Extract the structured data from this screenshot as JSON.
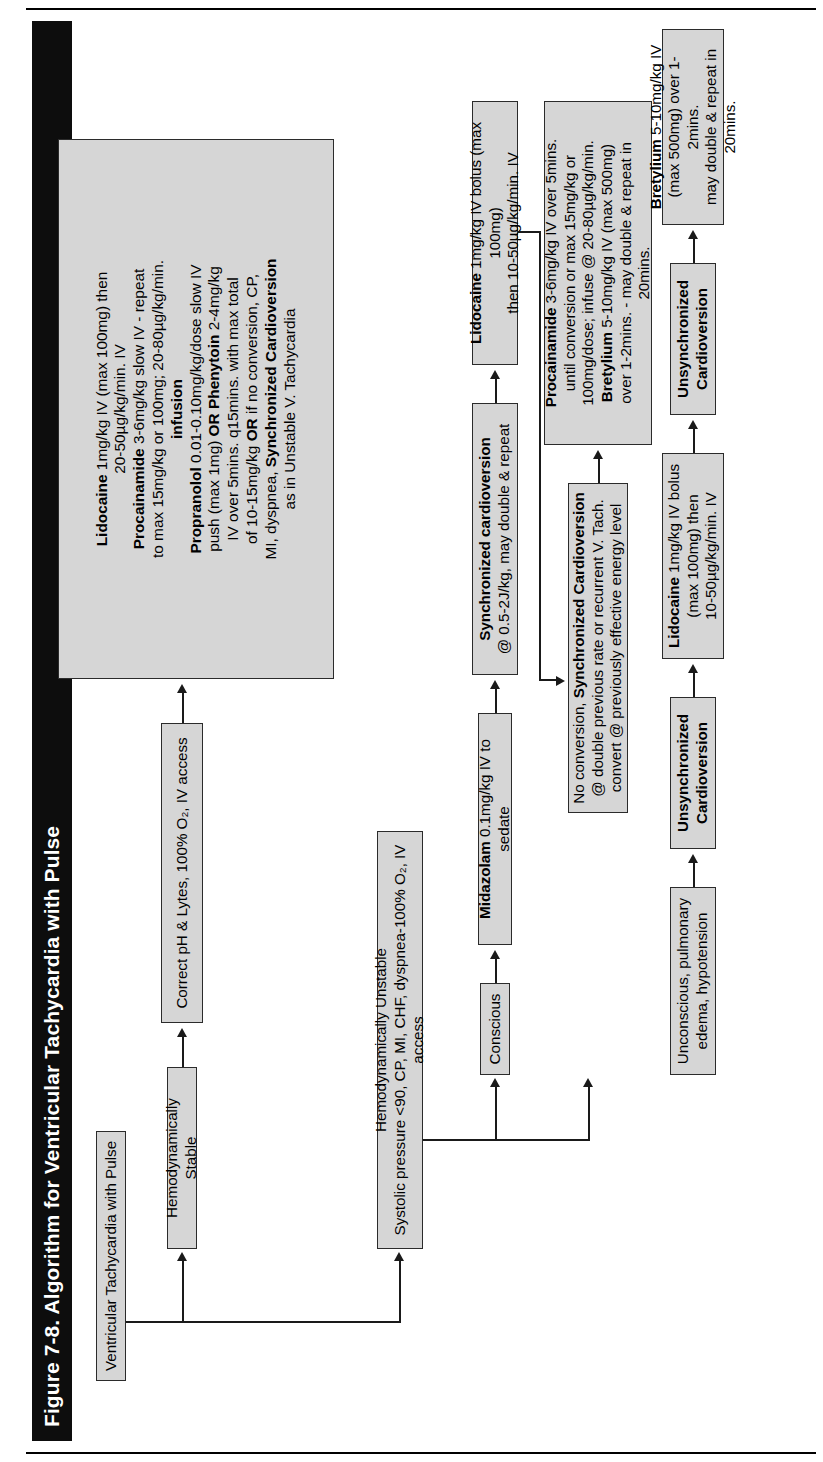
{
  "figure": {
    "title": "Figure 7-8. Algorithm for Ventricular Tachycardia with Pulse",
    "orientation": "rotated-90-ccw",
    "page_rules": 2
  },
  "colors": {
    "title_bar": "#0d0d0d",
    "title_text": "#ffffff",
    "node_fill": "#d6d6d6",
    "node_border": "#2b2b2b",
    "connector": "#1a1a1a",
    "page_background": "#ffffff"
  },
  "nodes": {
    "root": {
      "id": "root",
      "label": "Ventricular Tachycardia with Pulse"
    },
    "stable": {
      "id": "stable",
      "label": "Hemodynamically Stable"
    },
    "correct": {
      "id": "correct",
      "label": "Correct pH & Lytes, 100% O₂, IV access"
    },
    "stable_drugs": {
      "id": "stable-drug-protocol",
      "lines": [
        {
          "bold": "Lidocaine",
          "rest": " 1mg/kg IV (max 100mg) then"
        },
        {
          "bold": "",
          "rest": "20-50µg/kg/min. IV"
        },
        {
          "bold": "Procainamide",
          "rest": " 3-6mg/kg slow IV - repeat"
        },
        {
          "bold": "",
          "rest": "to max 15mg/kg or 100mg; 20-80µg/kg/min."
        },
        {
          "bold": "infusion",
          "rest": ""
        },
        {
          "bold": "Propranolol",
          "rest": " 0.01-0.10mg/kg/dose slow IV"
        },
        {
          "bold": "",
          "rest": "push (max 1mg) OR Phenytoin 2-4mg/kg"
        },
        {
          "bold": "",
          "rest": "IV over 5mins. q15mins. with max total"
        },
        {
          "bold": "",
          "rest": "of 10-15mg/kg OR if no conversion, CP,"
        },
        {
          "bold": "",
          "rest": "MI, dyspnea, Synchronized Cardioversion"
        },
        {
          "bold": "",
          "rest": "as in Unstable V. Tachycardia"
        }
      ]
    },
    "unstable": {
      "id": "unstable",
      "line1": "Hemodynamically Unstable",
      "line2": "Systolic pressure <90, CP, MI, CHF, dyspnea-100% O₂, IV access"
    },
    "conscious": {
      "id": "conscious",
      "label": "Conscious"
    },
    "midazolam": {
      "id": "midazolam",
      "bold": "Midazolam",
      "rest": " 0.1mg/kg IV to sedate"
    },
    "sync_cardio_1": {
      "id": "synchronized-cardioversion-dose",
      "line1_bold": "Synchronized cardioversion",
      "line2": "@ 0.5-2J/kg, may double & repeat"
    },
    "lidocaine_conscious": {
      "id": "lidocaine-conscious",
      "bold": "Lidocaine",
      "rest": " 1mg/kg IV bolus (max 100mg)",
      "line2": "then 10-50µg/kg/min. IV"
    },
    "no_conversion": {
      "id": "no-conversion-sync-cardioversion",
      "line1_pre": "No conversion, ",
      "line1_bold": "Synchronized Cardioversion",
      "line2": "@ double previous rate or recurrent V. Tach.",
      "line3": "convert @ previously effective energy level"
    },
    "procainamide_bretylium": {
      "id": "procainamide-bretylium",
      "lines": [
        {
          "bold": "Procainamide",
          "rest": " 3-6mg/kg IV over 5mins."
        },
        {
          "bold": "",
          "rest": "until conversion or max 15mg/kg or"
        },
        {
          "bold": "",
          "rest": "100mg/dose; infuse @ 20-80µg/kg/min."
        },
        {
          "bold": "Bretylium",
          "rest": " 5-10mg/kg IV (max 500mg)"
        },
        {
          "bold": "",
          "rest": "over 1-2mins. - may double & repeat in"
        },
        {
          "bold": "",
          "rest": "20mins."
        }
      ]
    },
    "unconscious": {
      "id": "unconscious",
      "line1": "Unconscious, pulmonary",
      "line2": "edema, hypotension"
    },
    "unsync_cardio_1": {
      "id": "unsynchronized-cardioversion-1",
      "line1": "Unsynchronized",
      "line2": "Cardioversion"
    },
    "lidocaine_unconscious": {
      "id": "lidocaine-unconscious",
      "bold": "Lidocaine",
      "rest": " 1mg/kg IV bolus",
      "line2": "(max 100mg) then",
      "line3": "10-50µg/kg/min. IV"
    },
    "unsync_cardio_2": {
      "id": "unsynchronized-cardioversion-2",
      "line1": "Unsynchronized",
      "line2": "Cardioversion"
    },
    "bretylium_unconscious": {
      "id": "bretylium-unconscious",
      "bold": "Bretylium",
      "rest": " 5-10mg/kg IV",
      "line2": "(max 500mg) over 1-2mins.",
      "line3": "may double & repeat in 20mins."
    }
  },
  "edges": [
    {
      "from": "root",
      "to": "stable"
    },
    {
      "from": "root",
      "to": "unstable"
    },
    {
      "from": "stable",
      "to": "correct"
    },
    {
      "from": "correct",
      "to": "stable_drugs"
    },
    {
      "from": "unstable",
      "to": "conscious"
    },
    {
      "from": "unstable",
      "to": "unconscious"
    },
    {
      "from": "conscious",
      "to": "midazolam"
    },
    {
      "from": "midazolam",
      "to": "sync_cardio_1"
    },
    {
      "from": "sync_cardio_1",
      "to": "lidocaine_conscious"
    },
    {
      "from": "lidocaine_conscious",
      "to": "no_conversion"
    },
    {
      "from": "no_conversion",
      "to": "procainamide_bretylium"
    },
    {
      "from": "unconscious",
      "to": "unsync_cardio_1"
    },
    {
      "from": "unsync_cardio_1",
      "to": "lidocaine_unconscious"
    },
    {
      "from": "lidocaine_unconscious",
      "to": "unsync_cardio_2"
    },
    {
      "from": "unsync_cardio_2",
      "to": "bretylium_unconscious"
    }
  ]
}
